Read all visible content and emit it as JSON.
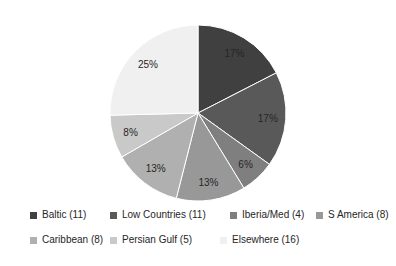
{
  "chart_data": {
    "type": "pie",
    "title": "",
    "total": 63,
    "direction": "clockwise",
    "start_angle_deg": 0,
    "legend_position": "bottom",
    "label_color": "#262626",
    "slice_border_color": "#ffffff",
    "slices": [
      {
        "key": "baltic",
        "label": "Baltic (11)",
        "name": "Baltic",
        "count": 11,
        "percent_label": "17%",
        "color": "#404040"
      },
      {
        "key": "low-countries",
        "label": "Low Countries (11)",
        "name": "Low Countries",
        "count": 11,
        "percent_label": "17%",
        "color": "#595959"
      },
      {
        "key": "iberia-med",
        "label": "Iberia/Med (4)",
        "name": "Iberia/Med",
        "count": 4,
        "percent_label": "6%",
        "color": "#7f7f7f"
      },
      {
        "key": "s-america",
        "label": "S America (8)",
        "name": "S America",
        "count": 8,
        "percent_label": "13%",
        "color": "#989898"
      },
      {
        "key": "caribbean",
        "label": "Caribbean (8)",
        "name": "Caribbean",
        "count": 8,
        "percent_label": "13%",
        "color": "#b0b0b0"
      },
      {
        "key": "persian-gulf",
        "label": "Persian Gulf (5)",
        "name": "Persian Gulf",
        "count": 5,
        "percent_label": "8%",
        "color": "#c9c9c9"
      },
      {
        "key": "elsewhere",
        "label": "Elsewhere (16)",
        "name": "Elsewhere",
        "count": 16,
        "percent_label": "25%",
        "color": "#f0f0f0"
      }
    ]
  }
}
